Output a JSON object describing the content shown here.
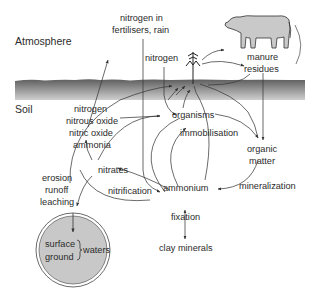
{
  "zones": {
    "atmosphere": "Atmosphere",
    "soil": "Soil"
  },
  "labels": {
    "nitrogen_fertilisers_line1": "nitrogen in",
    "nitrogen_fertilisers_line2": "fertilisers, rain",
    "nitrogen_atmos": "nitrogen",
    "manure": "manure",
    "residues": "residues",
    "gases": [
      "nitrogen",
      "nitrous oxide",
      "nitric oxide",
      "ammonia"
    ],
    "organisms": "organisms",
    "immobilisation": "immobilisation",
    "organic_matter_line1": "organic",
    "organic_matter_line2": "matter",
    "nitrates": "nitrates",
    "nitrification": "nitrification",
    "ammonium": "ammonium",
    "mineralization": "mineralization",
    "losses": [
      "erosion",
      "runoff",
      "leaching"
    ],
    "fixation": "fixation",
    "clay_minerals": "clay minerals",
    "surface": "surface",
    "ground": "ground",
    "waters": "waters"
  },
  "colors": {
    "soil_band_top": "#6e6e6e",
    "soil_band_bottom": "#c4c4c4",
    "water_fill": "#c8c8c8",
    "line": "#3a3a3a",
    "cow_fill": "#c9c9c9"
  }
}
